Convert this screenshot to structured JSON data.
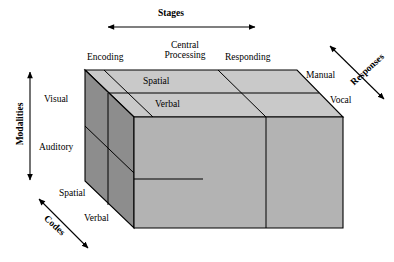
{
  "diagram": {
    "title_axis_top": "Stages",
    "axis_left": "Modalities",
    "axis_right": "Responses",
    "axis_bottom_left": "Codes",
    "stages": [
      {
        "label": "Encoding"
      },
      {
        "label_line1": "Central",
        "label_line2": "Processing"
      },
      {
        "label": "Responding"
      }
    ],
    "modalities": [
      {
        "label": "Visual"
      },
      {
        "label": "Auditory"
      }
    ],
    "codes": [
      {
        "label": "Spatial"
      },
      {
        "label": "Verbal"
      }
    ],
    "responses": [
      {
        "label": "Manual"
      },
      {
        "label": "Vocal"
      }
    ],
    "top_face_bands": [
      {
        "label": "Spatial"
      },
      {
        "label": "Verbal"
      }
    ],
    "colors": {
      "top_face": "#c9c9c9",
      "front_face": "#b3b3b3",
      "left_face": "#8d8d8d",
      "outline": "#000000",
      "background": "#ffffff"
    }
  }
}
